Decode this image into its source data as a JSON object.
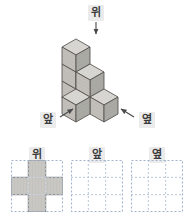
{
  "figure": {
    "type": "isometric-cube-stack-worksheet",
    "language": "ko",
    "background_color": "#ffffff"
  },
  "scene": {
    "direction_labels": {
      "top": "위",
      "front": "앞",
      "side": "옆"
    },
    "arrows": [
      {
        "name": "arrow-top",
        "points": "down",
        "label": "위"
      },
      {
        "name": "arrow-front",
        "points": "up-right",
        "label": "앞"
      },
      {
        "name": "arrow-side",
        "points": "up-left",
        "label": "옆"
      }
    ],
    "cube_count": 6,
    "cube_colors": {
      "top_face": "#d8d6d2",
      "left_face": "#bfbcb7",
      "right_face": "#a8a5a0",
      "outline": "#55514d"
    }
  },
  "views": [
    {
      "name": "top-view",
      "caption": "위",
      "rows": 3,
      "cols": 3,
      "filled": [
        [
          false,
          true,
          false
        ],
        [
          true,
          true,
          true
        ],
        [
          false,
          true,
          false
        ]
      ]
    },
    {
      "name": "front-view",
      "caption": "앞",
      "rows": 3,
      "cols": 3,
      "filled": [
        [
          false,
          false,
          false
        ],
        [
          false,
          false,
          false
        ],
        [
          false,
          false,
          false
        ]
      ]
    },
    {
      "name": "side-view",
      "caption": "옆",
      "rows": 3,
      "cols": 3,
      "filled": [
        [
          false,
          false,
          false
        ],
        [
          false,
          false,
          false
        ],
        [
          false,
          false,
          false
        ]
      ]
    }
  ],
  "grid_style": {
    "border_color": "#9fb3cf",
    "line_color": "#b9c6d8",
    "fill_color": "#c9c7c3",
    "fill_stroke": "#8d8a86"
  }
}
